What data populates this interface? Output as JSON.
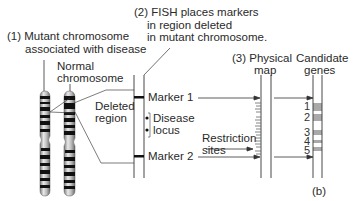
{
  "labels": {
    "step1_line1": "(1) Mutant chromosome",
    "step1_line2": "associated with disease",
    "normal_line1": "Normal",
    "normal_line2": "chromosome",
    "step2_line1": "(2) FISH places markers",
    "step2_line2": "in region deleted",
    "step2_line3": "in mutant chromosome.",
    "deleted_line1": "Deleted",
    "deleted_line2": "region",
    "marker1": "Marker 1",
    "marker2": "Marker 2",
    "disease_line1": "Disease",
    "disease_line2": "locus",
    "step3_line1": "(3) Physical",
    "step3_line2": "map",
    "candidate_line1": "Candidate",
    "candidate_line2": "genes",
    "restriction_line1": "Restriction",
    "restriction_line2": "sites",
    "panel": "(b)"
  },
  "candidate_genes": [
    {
      "label": "1"
    },
    {
      "label": "2"
    },
    {
      "label": "3"
    },
    {
      "label": "4"
    },
    {
      "label": "5"
    }
  ],
  "colors": {
    "line": "#333333",
    "gene_band": "#a9a9a9",
    "chromosome_dark": "#111111",
    "chromosome_light": "#c8c8c8"
  }
}
